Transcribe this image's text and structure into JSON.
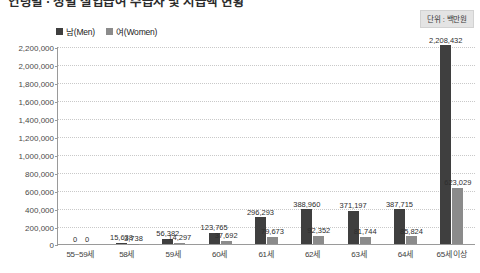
{
  "header": {
    "title": "연령별 · 성별 실업급여 수급자 및 지급액 현황",
    "unit_badge": "단위 : 백만원"
  },
  "legend": {
    "position": "top-left",
    "items": [
      {
        "label": "남(Men)",
        "color": "#3f3f3f"
      },
      {
        "label": "여(Women)",
        "color": "#8b8b8b"
      }
    ]
  },
  "chart_data": {
    "type": "bar",
    "title": "연령별 · 성별 실업급여 수급자 및 지급액 현황",
    "xlabel": "",
    "ylabel": "",
    "unit": "단위 : 백만원",
    "ylim": [
      0,
      2200000
    ],
    "ytick_interval": 200000,
    "grid": true,
    "legend_position": "top-left",
    "categories": [
      "55~59세",
      "58세",
      "59세",
      "60세",
      "61세",
      "62세",
      "63세",
      "64세",
      "65세 이상"
    ],
    "yticks": [
      "0",
      "200,000",
      "400,000",
      "600,000",
      "800,000",
      "1,000,000",
      "1,200,000",
      "1,400,000",
      "1,600,000",
      "1,800,000",
      "2,000,000",
      "2,200,000"
    ],
    "series": [
      {
        "name": "남(Men)",
        "color": "#3f3f3f",
        "values": [
          0,
          15638,
          56382,
          123765,
          296293,
          388960,
          371197,
          387715,
          2208432
        ],
        "labels": [
          "0",
          "15,638",
          "56,382",
          "123,765",
          "296,293",
          "388,960",
          "371,197",
          "387,715",
          "2,208,432"
        ]
      },
      {
        "name": "여(Women)",
        "color": "#8b8b8b",
        "values": [
          0,
          3738,
          14297,
          37692,
          79673,
          92352,
          81744,
          85824,
          623029
        ],
        "labels": [
          "0",
          "3,738",
          "14,297",
          "37,692",
          "79,673",
          "92,352",
          "81,744",
          "85,824",
          "623,029"
        ]
      }
    ]
  }
}
